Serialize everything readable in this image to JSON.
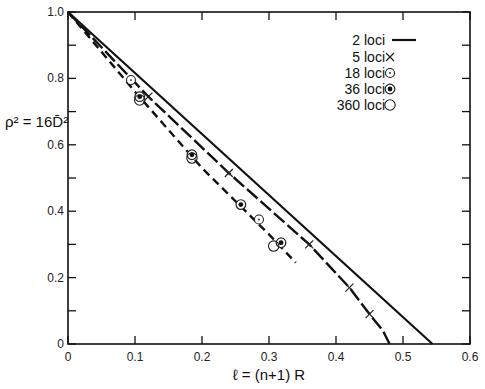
{
  "chart_data": {
    "type": "line",
    "title": "",
    "xlabel": "ℓ = (n+1) R",
    "ylabel": "ρ² = 16D̄²",
    "xlim": [
      0,
      0.6
    ],
    "ylim": [
      0,
      1.0
    ],
    "x_ticks": [
      "0",
      "0.1",
      "0.2",
      "0.3",
      "0.4",
      "0.5",
      "0.6"
    ],
    "y_ticks": [
      "0",
      "0.2",
      "0.4",
      "0.6",
      "0.8",
      "1.0"
    ],
    "grid": false,
    "legend_position": "upper right",
    "legend": [
      {
        "label": "2 loci",
        "marker": "solid-line"
      },
      {
        "label": "5 loci",
        "marker": "x"
      },
      {
        "label": "18 loci",
        "marker": "dotted-circle"
      },
      {
        "label": "36 loci",
        "marker": "bullseye"
      },
      {
        "label": "360 loci",
        "marker": "open-circle"
      }
    ],
    "series": [
      {
        "name": "2 loci",
        "style": "solid",
        "points": [
          [
            0,
            1.0
          ],
          [
            0.544,
            0.0
          ]
        ]
      },
      {
        "name": "5 loci curve",
        "style": "long-dash",
        "points": [
          [
            0,
            1.0
          ],
          [
            0.12,
            0.745
          ],
          [
            0.24,
            0.515
          ],
          [
            0.36,
            0.3
          ],
          [
            0.42,
            0.17
          ],
          [
            0.45,
            0.09
          ],
          [
            0.47,
            0.04
          ],
          [
            0.48,
            0.0
          ]
        ]
      },
      {
        "name": "many loci curve",
        "style": "short-dash",
        "points": [
          [
            0,
            1.0
          ],
          [
            0.1,
            0.76
          ],
          [
            0.2,
            0.53
          ],
          [
            0.3,
            0.33
          ],
          [
            0.34,
            0.245
          ]
        ]
      },
      {
        "name": "5 loci",
        "marker": "x",
        "points": [
          [
            0.12,
            0.745
          ],
          [
            0.24,
            0.515
          ],
          [
            0.36,
            0.3
          ],
          [
            0.42,
            0.17
          ],
          [
            0.45,
            0.09
          ]
        ]
      },
      {
        "name": "18 loci",
        "marker": "dotted-circle",
        "points": [
          [
            0.094,
            0.795
          ],
          [
            0.285,
            0.375
          ]
        ]
      },
      {
        "name": "36 loci",
        "marker": "bullseye",
        "points": [
          [
            0.107,
            0.745
          ],
          [
            0.185,
            0.57
          ],
          [
            0.258,
            0.42
          ],
          [
            0.318,
            0.305
          ]
        ]
      },
      {
        "name": "360 loci",
        "marker": "open-circle",
        "points": [
          [
            0.107,
            0.735
          ],
          [
            0.185,
            0.56
          ],
          [
            0.307,
            0.295
          ]
        ]
      }
    ]
  }
}
